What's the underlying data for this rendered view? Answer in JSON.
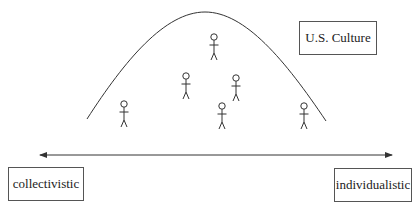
{
  "diagram": {
    "curve": {
      "start": [
        87,
        119
      ],
      "peak": [
        205,
        12
      ],
      "end": [
        326,
        121
      ]
    },
    "axis": {
      "x1": 38,
      "x2": 394,
      "y": 155,
      "bidirectional": true
    },
    "labels": {
      "culture": "U.S. Culture",
      "left_pole": "collectivistic",
      "right_pole": "individualistic"
    },
    "people": [
      {
        "x": 124,
        "y": 104
      },
      {
        "x": 186,
        "y": 76
      },
      {
        "x": 214,
        "y": 37
      },
      {
        "x": 236,
        "y": 78
      },
      {
        "x": 222,
        "y": 106
      },
      {
        "x": 304,
        "y": 106
      }
    ],
    "colors": {
      "line": "#333333",
      "text": "#222222",
      "background": "#ffffff"
    }
  }
}
